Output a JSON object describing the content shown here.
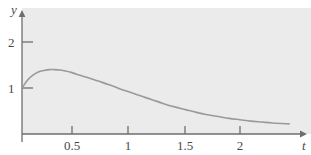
{
  "figure": {
    "width": 311,
    "height": 155,
    "background_color": "#ffffff",
    "plot_background_color": "#ebebeb"
  },
  "axes": {
    "x_axis_name": "t",
    "y_axis_name": "y",
    "axis_color": "#6e6e6e",
    "x_tick_labels": [
      "0.5",
      "1",
      "1.5",
      "2"
    ],
    "x_tick_values": [
      0.5,
      1,
      1.5,
      2
    ],
    "y_tick_labels": [
      "1",
      "2"
    ],
    "y_tick_values": [
      1,
      2
    ]
  },
  "chart_data": {
    "type": "line",
    "title": "",
    "xlabel": "t",
    "ylabel": "y",
    "xlim": [
      0,
      2.45
    ],
    "ylim": [
      0,
      2.6
    ],
    "grid": false,
    "legend": null,
    "line_color": "#9a9a9a",
    "line_width": 1.6,
    "x": [
      0,
      0.05,
      0.1,
      0.15,
      0.2,
      0.25,
      0.3,
      0.35,
      0.4,
      0.45,
      0.5,
      0.6,
      0.7,
      0.8,
      0.9,
      1.0,
      1.1,
      1.2,
      1.3,
      1.4,
      1.5,
      1.6,
      1.7,
      1.8,
      1.9,
      2.0,
      2.1,
      2.2,
      2.3,
      2.45
    ],
    "y": [
      1.0,
      1.17,
      1.28,
      1.35,
      1.38,
      1.4,
      1.4,
      1.39,
      1.37,
      1.34,
      1.3,
      1.23,
      1.15,
      1.07,
      0.98,
      0.9,
      0.82,
      0.74,
      0.66,
      0.59,
      0.53,
      0.47,
      0.42,
      0.38,
      0.34,
      0.31,
      0.28,
      0.26,
      0.24,
      0.22
    ],
    "annotations": [
      {
        "label": "curve starts at y = 1 on the vertical axis",
        "x": 0,
        "y": 1.0
      },
      {
        "label": "peak of curve",
        "x": 0.3,
        "y": 1.4
      }
    ]
  }
}
